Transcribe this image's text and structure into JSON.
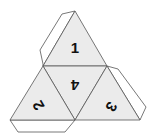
{
  "diagram": {
    "faces": [
      {
        "id": "top",
        "label": "1"
      },
      {
        "id": "center",
        "label": "4"
      },
      {
        "id": "left",
        "label": "2"
      },
      {
        "id": "right",
        "label": "3"
      }
    ],
    "colors": {
      "face": "#ebebeb",
      "stroke": "#555555",
      "flap": "#ffffff"
    }
  }
}
